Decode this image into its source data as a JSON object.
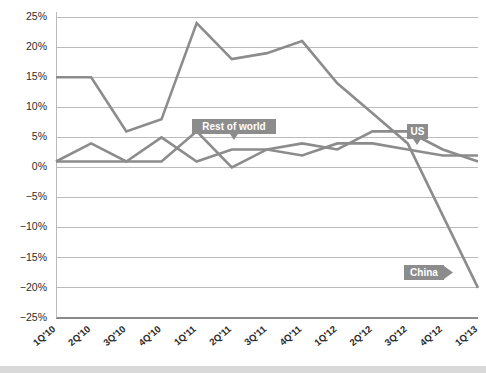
{
  "chart_data": {
    "type": "line",
    "title": "",
    "subtitle": "",
    "xlabel": "",
    "ylabel": "",
    "grid": true,
    "legend_position": "inline-annotations",
    "ylim": [
      -25,
      25
    ],
    "ytick_step": 5,
    "ytick_labels": [
      "25%",
      "20%",
      "15%",
      "10%",
      "5%",
      "0%",
      "−5%",
      "−10%",
      "−15%",
      "−20%",
      "−25%"
    ],
    "ytick_values": [
      25,
      20,
      15,
      10,
      5,
      0,
      -5,
      -10,
      -15,
      -20,
      -25
    ],
    "categories": [
      "1Q'10",
      "2Q'10",
      "3Q'10",
      "4Q'10",
      "1Q'11",
      "2Q'11",
      "3Q'11",
      "4Q'11",
      "1Q'12",
      "2Q'12",
      "3Q'12",
      "4Q'12",
      "1Q'13"
    ],
    "series": [
      {
        "name": "China",
        "color": "#8c8c8c",
        "stroke_width": 2.6,
        "values": [
          15,
          15,
          6,
          8,
          24,
          18,
          19,
          21,
          14,
          9,
          4,
          -8,
          -20
        ]
      },
      {
        "name": "US",
        "color": "#8c8c8c",
        "stroke_width": 2.6,
        "values": [
          1,
          4,
          1,
          5,
          1,
          3,
          3,
          2,
          4,
          4,
          3,
          2,
          2
        ]
      },
      {
        "name": "Rest of world",
        "color": "#8c8c8c",
        "stroke_width": 2.6,
        "values": [
          1,
          1,
          1,
          1,
          6,
          0,
          3,
          4,
          3,
          6,
          6,
          3,
          1
        ]
      }
    ],
    "annotations": [
      {
        "text": "Rest of world",
        "series": "Rest of world",
        "pointer": "down"
      },
      {
        "text": "US",
        "series": "US",
        "pointer": "down"
      },
      {
        "text": "China",
        "series": "China",
        "pointer": "right"
      }
    ]
  },
  "colors": {
    "line": "#8c8c8c",
    "gridline": "#b4b4b4",
    "axis": "#8a8a8a",
    "label_box": "#8c8c8c",
    "label_text": "#ffffff",
    "tick_text": "#2b2b2b",
    "background": "#ffffff",
    "footer_bar": "#d9d9d9"
  }
}
